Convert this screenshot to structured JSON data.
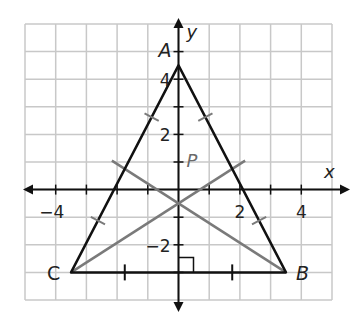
{
  "axes": {
    "x_label": "x",
    "y_label": "y",
    "x_range": [
      -5,
      5
    ],
    "y_range": [
      -4,
      6
    ]
  },
  "ticks": {
    "x": [
      {
        "value": -4,
        "label": "−4"
      },
      {
        "value": 2,
        "label": "2"
      },
      {
        "value": 4,
        "label": "4"
      }
    ],
    "y": [
      {
        "value": 4,
        "label": "4"
      },
      {
        "value": 2,
        "label": "2"
      },
      {
        "value": -2,
        "label": "−2"
      }
    ]
  },
  "points": {
    "A": {
      "label": "A",
      "x": 0,
      "y": 4.5
    },
    "B": {
      "label": "B",
      "x": 3.5,
      "y": -3
    },
    "C": {
      "label": "C",
      "x": -3.5,
      "y": -3
    },
    "P": {
      "label": "P",
      "x": 0,
      "y": 1
    }
  },
  "colors": {
    "grid": "#c8c8c8",
    "triangle": "#111111",
    "median": "#7a7a7a",
    "text": "#222222"
  }
}
